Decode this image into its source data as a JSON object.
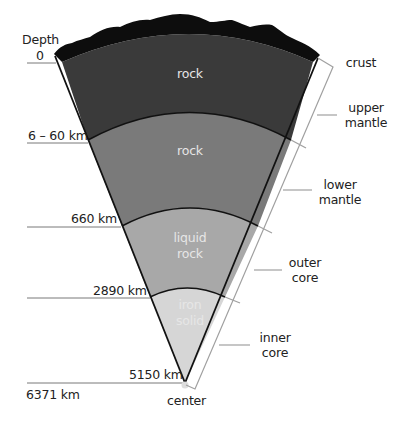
{
  "diagram": {
    "type": "earth-cross-section-wedge",
    "depth_axis_title": "Depth",
    "depth_ticks": [
      {
        "label": "0"
      },
      {
        "label": "6 – 60 km"
      },
      {
        "label": "660 km"
      },
      {
        "label": "2890 km"
      },
      {
        "label": "5150 km"
      },
      {
        "label": "6371 km"
      }
    ],
    "center_label": "center",
    "layers": [
      {
        "name": "crust",
        "label_lines": [
          "crust"
        ],
        "material_lines": [],
        "color": "#0d0d0d"
      },
      {
        "name": "upper mantle",
        "label_lines": [
          "upper",
          "mantle"
        ],
        "material_lines": [
          "rock"
        ],
        "color": "#3a3a3a"
      },
      {
        "name": "lower mantle",
        "label_lines": [
          "lower",
          "mantle"
        ],
        "material_lines": [
          "rock"
        ],
        "color": "#7a7a7a"
      },
      {
        "name": "outer core",
        "label_lines": [
          "outer",
          "core"
        ],
        "material_lines": [
          "liquid",
          "rock"
        ],
        "color": "#a8a8a8"
      },
      {
        "name": "inner core",
        "label_lines": [
          "inner",
          "core"
        ],
        "material_lines": [
          "iron",
          "solid"
        ],
        "color": "#d6d6d6"
      }
    ],
    "colors": {
      "outline": "#111111",
      "bracket": "#a0a0a0",
      "tick_line": "#555555",
      "label_text": "#222222",
      "inner_text": "#e6e6e6"
    }
  }
}
